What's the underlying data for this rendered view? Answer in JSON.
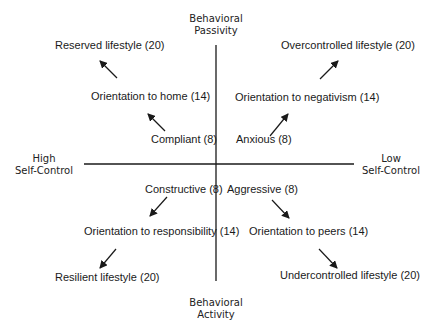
{
  "axes": {
    "top": {
      "line1": "Behavioral",
      "line2": "Passivity"
    },
    "bottom": {
      "line1": "Behavioral",
      "line2": "Activity"
    },
    "left": {
      "line1": "High",
      "line2": "Self-Control"
    },
    "right": {
      "line1": "Low",
      "line2": "Self-Control"
    }
  },
  "quadrants": {
    "top_left": {
      "inner": "Compliant (8)",
      "middle": "Orientation to home (14)",
      "outer": "Reserved lifestyle (20)"
    },
    "top_right": {
      "inner": "Anxious (8)",
      "middle": "Orientation to negativism (14)",
      "outer": "Overcontrolled lifestyle (20)"
    },
    "bottom_left": {
      "inner": "Constructive (8)",
      "middle": "Orientation to responsibility (14)",
      "outer": "Resilient lifestyle (20)"
    },
    "bottom_right": {
      "inner": "Aggressive (8)",
      "middle": "Orientation to peers (14)",
      "outer": "Undercontrolled lifestyle (20)"
    }
  },
  "colors": {
    "line": "#1a1a1a",
    "text": "#1a1a1a",
    "background": "#ffffff"
  }
}
